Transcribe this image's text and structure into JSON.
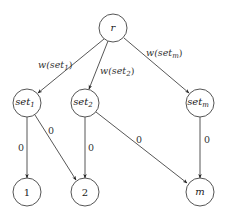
{
  "diagram": {
    "type": "directed-graph",
    "nodes": [
      {
        "id": "r",
        "label": "r",
        "x": 113,
        "y": 28
      },
      {
        "id": "set1",
        "label": "set",
        "sub": "1",
        "x": 27,
        "y": 103
      },
      {
        "id": "set2",
        "label": "set",
        "sub": "2",
        "x": 85,
        "y": 103
      },
      {
        "id": "setm",
        "label": "set",
        "sub": "m",
        "x": 200,
        "y": 103
      },
      {
        "id": "n1",
        "label": "1",
        "x": 27,
        "y": 192
      },
      {
        "id": "n2",
        "label": "2",
        "x": 85,
        "y": 192
      },
      {
        "id": "nm",
        "label": "m",
        "x": 200,
        "y": 192
      }
    ],
    "edges": [
      {
        "from": "r",
        "to": "set1",
        "label": "w(set",
        "sub": "1",
        "close": ")"
      },
      {
        "from": "r",
        "to": "set2",
        "label": "w(set",
        "sub": "2",
        "close": ")"
      },
      {
        "from": "r",
        "to": "setm",
        "label": "w(set",
        "sub": "m",
        "close": ")"
      },
      {
        "from": "set1",
        "to": "n1",
        "label": "0"
      },
      {
        "from": "set1",
        "to": "n2",
        "label": "0"
      },
      {
        "from": "set2",
        "to": "n2",
        "label": "0"
      },
      {
        "from": "set2",
        "to": "nm",
        "label": "0"
      },
      {
        "from": "setm",
        "to": "nm",
        "label": "0"
      }
    ]
  }
}
